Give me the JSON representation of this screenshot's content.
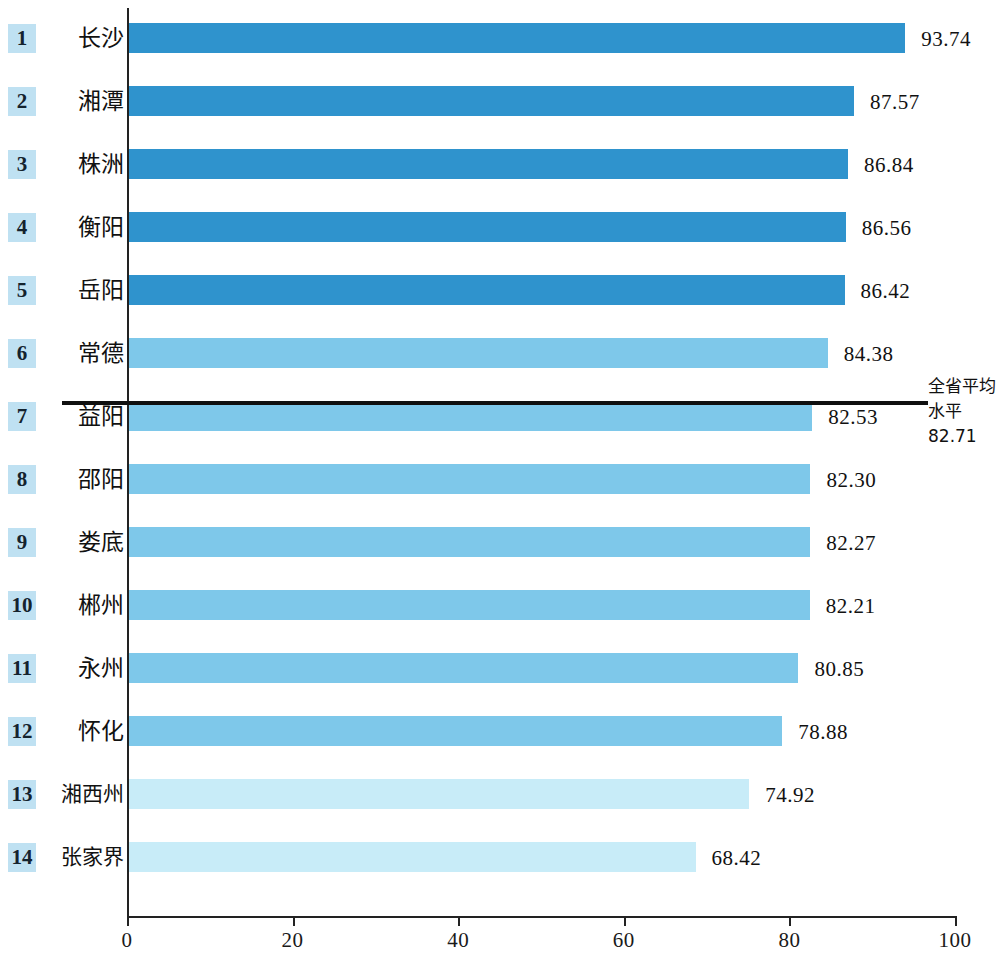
{
  "chart_data": {
    "type": "bar",
    "orientation": "horizontal",
    "title": "",
    "subtitle": "",
    "xlabel": "",
    "ylabel": "",
    "xlim": [
      0,
      100
    ],
    "ylim": null,
    "grid": false,
    "legend": null,
    "categories": [
      "长沙",
      "湘潭",
      "株洲",
      "衡阳",
      "岳阳",
      "常德",
      "益阳",
      "邵阳",
      "娄底",
      "郴州",
      "永州",
      "怀化",
      "湘西州",
      "张家界"
    ],
    "values": [
      93.74,
      87.57,
      86.84,
      86.56,
      86.42,
      84.38,
      82.53,
      82.3,
      82.27,
      82.21,
      80.85,
      78.88,
      74.92,
      68.42
    ],
    "value_labels": [
      "93.74",
      "87.57",
      "86.84",
      "86.56",
      "86.42",
      "84.38",
      "82.53",
      "82.30",
      "82.27",
      "82.21",
      "80.85",
      "78.88",
      "74.92",
      "68.42"
    ],
    "ranks": [
      "1",
      "2",
      "3",
      "4",
      "5",
      "6",
      "7",
      "8",
      "9",
      "10",
      "11",
      "12",
      "13",
      "14"
    ],
    "xticks": [
      0,
      20,
      40,
      60,
      80,
      100
    ],
    "xtick_labels": [
      "0",
      "20",
      "40",
      "60",
      "80",
      "100"
    ],
    "annotations": [
      {
        "name": "provincial-average-line",
        "text_line1": "全省平均",
        "text_line2": "水平82.71",
        "value": 82.71,
        "position": "between rank 6 and rank 7"
      }
    ],
    "series_colors": {
      "tier_dark": "#2f93cd",
      "tier_mid": "#7ec8ea",
      "tier_light": "#c8ecf8",
      "rank_badge": "#bfe1f2",
      "axis": "#222222",
      "average_line": "#101010"
    },
    "bar_tiers": [
      "dark",
      "dark",
      "dark",
      "dark",
      "dark",
      "mid",
      "mid",
      "mid",
      "mid",
      "mid",
      "mid",
      "mid",
      "light",
      "light"
    ]
  },
  "axis": {
    "x_tick_0": "0",
    "x_tick_1": "20",
    "x_tick_2": "40",
    "x_tick_3": "60",
    "x_tick_4": "80",
    "x_tick_5": "100"
  },
  "rows": [
    {
      "rank": "1",
      "city": "长沙",
      "value": "93.74"
    },
    {
      "rank": "2",
      "city": "湘潭",
      "value": "87.57"
    },
    {
      "rank": "3",
      "city": "株洲",
      "value": "86.84"
    },
    {
      "rank": "4",
      "city": "衡阳",
      "value": "86.56"
    },
    {
      "rank": "5",
      "city": "岳阳",
      "value": "86.42"
    },
    {
      "rank": "6",
      "city": "常德",
      "value": "84.38"
    },
    {
      "rank": "7",
      "city": "益阳",
      "value": "82.53"
    },
    {
      "rank": "8",
      "city": "邵阳",
      "value": "82.30"
    },
    {
      "rank": "9",
      "city": "娄底",
      "value": "82.27"
    },
    {
      "rank": "10",
      "city": "郴州",
      "value": "82.21"
    },
    {
      "rank": "11",
      "city": "永州",
      "value": "80.85"
    },
    {
      "rank": "12",
      "city": "怀化",
      "value": "78.88"
    },
    {
      "rank": "13",
      "city": "湘西州",
      "value": "74.92"
    },
    {
      "rank": "14",
      "city": "张家界",
      "value": "68.42"
    }
  ],
  "average_note": {
    "line1": "全省平均",
    "line2": "水平82.71"
  }
}
